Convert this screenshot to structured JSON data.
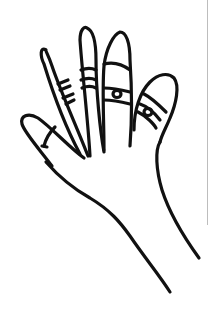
{
  "illustration": {
    "subject": "hand line drawing with rings on fingers",
    "stroke_color": "#111111",
    "background_color": "#ffffff",
    "edge_line_color": "#bdbdbd"
  }
}
